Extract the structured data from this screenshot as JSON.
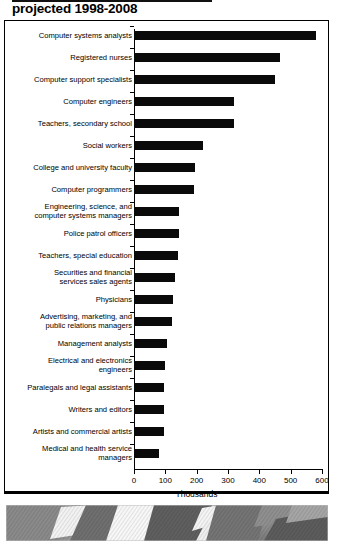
{
  "title": "projected 1998-2008",
  "chart_data": {
    "type": "bar",
    "orientation": "horizontal",
    "title": "projected 1998-2008",
    "xlabel": "Thousands",
    "ylabel": "",
    "xlim": [
      0,
      600
    ],
    "xticks": [
      0,
      100,
      200,
      300,
      400,
      500,
      600
    ],
    "xtick_labels": [
      "0",
      "100",
      "200",
      "300",
      "400",
      "500",
      "600"
    ],
    "grid": false,
    "legend": null,
    "bar_color": "#0a0a0a",
    "categories": [
      "Computer systems analysts",
      "Registered nurses",
      "Computer support specialists",
      "Computer engineers",
      "Teachers, secondary school",
      "Social workers",
      "College and university faculty",
      "Computer programmers",
      "Engineering, science, and\ncomputer systems managers",
      "Police patrol officers",
      "Teachers, special education",
      "Securities and financial\nservices sales agents",
      "Physicians",
      "Advertising, marketing, and\npublic relations managers",
      "Management analysts",
      "Electrical and electronics\nengineers",
      "Paralegals and legal assistants",
      "Writers and editors",
      "Artists and commercial artists",
      "Medical and health service\nmanagers"
    ],
    "values": [
      580,
      465,
      450,
      320,
      320,
      220,
      195,
      190,
      145,
      145,
      140,
      130,
      125,
      120,
      105,
      100,
      95,
      95,
      95,
      80
    ]
  },
  "flag": {
    "alt": "american-flag-strip",
    "grayscale": true
  }
}
